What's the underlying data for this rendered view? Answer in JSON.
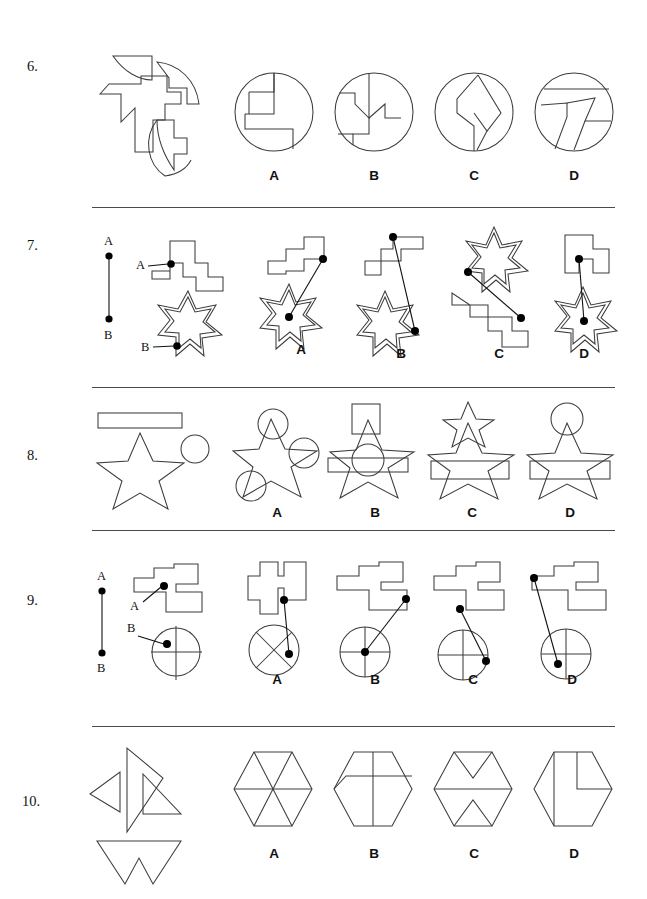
{
  "document": {
    "type": "spatial-reasoning-worksheet",
    "page_width": 647,
    "page_height": 899,
    "background_color": "#ffffff",
    "stroke_color": "#3c3c3c",
    "divider_color": "#4a4a4a"
  },
  "option_letters": [
    "A",
    "B",
    "C",
    "D"
  ],
  "questions": [
    {
      "number": "6.",
      "type": "shape-assembly-into-circle",
      "prompt_pieces": [
        "curved-wedge-top",
        "curved-arrow-right",
        "cross-polygon",
        "curved-arrow-bottom"
      ],
      "options": [
        {
          "letter": "A",
          "container": "circle",
          "description": "circle with rectangle and step lines, upper-left quadrant"
        },
        {
          "letter": "B",
          "container": "circle",
          "description": "circle with zigzag staircase lines"
        },
        {
          "letter": "C",
          "container": "circle",
          "description": "circle with angular arrow chevron"
        },
        {
          "letter": "D",
          "container": "circle",
          "description": "circle with T-shaped slanted bands"
        }
      ]
    },
    {
      "number": "7.",
      "type": "point-connection",
      "reference": {
        "top_label": "A",
        "bottom_label": "B",
        "line": "vertical segment with endpoint dots"
      },
      "source": {
        "shape_a": "staircase-polygon",
        "shape_a_point_label": "A",
        "shape_b": "seven-point-star",
        "shape_b_point_label": "B"
      },
      "options": [
        {
          "letter": "A",
          "description": "staircase above, star below-left, line from staircase dot to star centre"
        },
        {
          "letter": "B",
          "description": "staircase above, star below-left, line from top-left dot to star right edge"
        },
        {
          "letter": "C",
          "description": "star above, staircase below, line from star left to staircase right dot"
        },
        {
          "letter": "D",
          "description": "staircase above-right, star below, short line to star centre"
        }
      ]
    },
    {
      "number": "8.",
      "type": "shape-overlay",
      "source_shapes": [
        "rectangle-bar",
        "five-point-star",
        "small-circle"
      ],
      "options": [
        {
          "letter": "A",
          "description": "star with three circles overlapping at points"
        },
        {
          "letter": "B",
          "description": "star with square above apex, circle at centre, bar across middle"
        },
        {
          "letter": "C",
          "description": "star with small star above apex and bar across lower half"
        },
        {
          "letter": "D",
          "description": "star with circle above apex and bar across lower half"
        }
      ]
    },
    {
      "number": "9.",
      "type": "point-connection",
      "reference": {
        "top_label": "A",
        "bottom_label": "B",
        "line": "vertical segment with endpoint dots"
      },
      "source": {
        "shape_a": "stepped-blocky-polygon",
        "shape_a_point_label": "A",
        "shape_b": "circle-with-cross",
        "shape_b_point_label": "B"
      },
      "options": [
        {
          "letter": "A",
          "description": "polygon above, circle with X below, line from polygon to lower-right of circle"
        },
        {
          "letter": "B",
          "description": "polygon above, line from right dot to circle centre"
        },
        {
          "letter": "C",
          "description": "polygon above, line from left dot to circle right edge"
        },
        {
          "letter": "D",
          "description": "polygon above, line from far-left dot to circle lower-left"
        }
      ]
    },
    {
      "number": "10.",
      "type": "shape-assembly-into-hexagon",
      "prompt_pieces": [
        "triangle-left",
        "triangle-tall",
        "triangle-right",
        "arrow-notched-triangle"
      ],
      "options": [
        {
          "letter": "A",
          "container": "hexagon",
          "description": "hexagon divided into six triangles"
        },
        {
          "letter": "B",
          "container": "hexagon",
          "description": "hexagon with vertical line and horizontal offset line"
        },
        {
          "letter": "C",
          "container": "hexagon",
          "description": "hexagon with horizontal line and two V notches"
        },
        {
          "letter": "D",
          "container": "hexagon",
          "description": "hexagon with vertical line and stepped corner"
        }
      ]
    }
  ]
}
